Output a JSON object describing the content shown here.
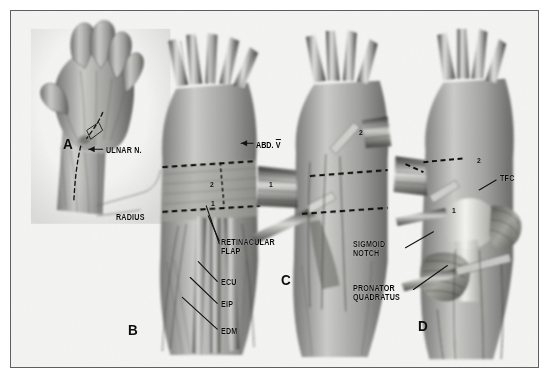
{
  "figure": {
    "kind": "medical-illustration",
    "background_color": "#f3f3f1",
    "ink_color": "#1a1a1a",
    "border_color": "#5d6063",
    "panels": [
      {
        "letter": "A",
        "x": 52,
        "y": 132,
        "caption": "dorsal hand, incision marked"
      },
      {
        "letter": "B",
        "x": 117,
        "y": 318,
        "caption": "extensor retinaculum exposed"
      },
      {
        "letter": "C",
        "x": 270,
        "y": 268,
        "caption": "retinacular flaps reflected"
      },
      {
        "letter": "D",
        "x": 407,
        "y": 314,
        "caption": "distal radioulnar joint exposed"
      }
    ],
    "labels": [
      {
        "id": "ulnar-nerve",
        "text": "ULNAR N.",
        "x": 95,
        "y": 140,
        "align": "left",
        "leader": "arrow-left"
      },
      {
        "id": "radius",
        "text": "RADIUS",
        "x": 105,
        "y": 207,
        "align": "left",
        "leader": "none"
      },
      {
        "id": "abductor-digiti-v",
        "text": "ABD. V",
        "x": 245,
        "y": 134,
        "align": "left",
        "leader": "arrow-left"
      },
      {
        "id": "retinacular-flap",
        "text": "RETINACULAR\nFLAP",
        "x": 210,
        "y": 232,
        "align": "left",
        "leader": "two-lines-up-left"
      },
      {
        "id": "ecu",
        "text": "ECU",
        "x": 210,
        "y": 272,
        "align": "left",
        "leader": "line-up-left"
      },
      {
        "id": "eip",
        "text": "EIP",
        "x": 210,
        "y": 294,
        "align": "left",
        "leader": "line-up-left"
      },
      {
        "id": "edm",
        "text": "EDM",
        "x": 210,
        "y": 321,
        "align": "left",
        "leader": "line-up-left"
      },
      {
        "id": "sigmoid-notch",
        "text": "SIGMOID\nNOTCH",
        "x": 350,
        "y": 234,
        "align": "left",
        "leader": "line-up-right"
      },
      {
        "id": "pronator-quadratus",
        "text": "PRONATOR\nQUADRATUS",
        "x": 350,
        "y": 278,
        "align": "left",
        "leader": "line-up-right"
      },
      {
        "id": "tfc",
        "text": "TFC",
        "x": 489,
        "y": 168,
        "align": "left",
        "leader": "line-down-left"
      }
    ],
    "flap_markers": [
      {
        "id": "flap-2-panel-b",
        "text": "2",
        "x": 199,
        "y": 174
      },
      {
        "id": "flap-1-panel-b",
        "text": "1",
        "x": 200,
        "y": 193
      },
      {
        "id": "flap-1-panel-c",
        "text": "1",
        "x": 258,
        "y": 174
      },
      {
        "id": "flap-2-panel-c",
        "text": "2",
        "x": 348,
        "y": 122
      },
      {
        "id": "flap-1-panel-d",
        "text": "1",
        "x": 441,
        "y": 200
      },
      {
        "id": "flap-2-panel-d",
        "text": "2",
        "x": 466,
        "y": 150
      }
    ]
  }
}
